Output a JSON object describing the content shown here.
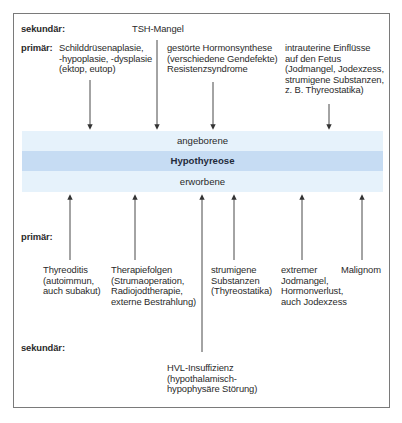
{
  "diagram": {
    "title": "Hypothyreose",
    "band": {
      "top_label": "angeborene",
      "center_label": "Hypothyreose",
      "bottom_label": "erworbene"
    },
    "colors": {
      "band_light": "#e6f2fb",
      "band_center": "#c6dcf3",
      "frame": "#7a7a7a",
      "lines": "#333333"
    },
    "congenital": {
      "secondary_label": "sekundär:",
      "primary_label": "primär:",
      "secondary": [
        {
          "lines": [
            "TSH-Mangel"
          ]
        }
      ],
      "primary": [
        {
          "lines": [
            "Schilddrüsenaplasie,",
            "-hypoplasie, -dysplasie",
            "(ektop, eutop)"
          ]
        },
        {
          "lines": [
            "gestörte Hormonsynthese",
            "(verschiedene Gendefekte)",
            "Resistenzsyndrome"
          ]
        },
        {
          "lines": [
            "intrauterine Einflüsse",
            "auf den Fetus",
            "(Jodmangel, Jodexzess,",
            "strumigene Substanzen,",
            "z. B. Thyreostatika)"
          ]
        }
      ]
    },
    "acquired": {
      "primary_label": "primär:",
      "secondary_label": "sekundär:",
      "primary": [
        {
          "lines": [
            "Thyreoditis",
            "(autoimmun,",
            "auch subakut)"
          ]
        },
        {
          "lines": [
            "Therapiefolgen",
            "(Strumaoperation,",
            "Radiojodtherapie,",
            "externe Bestrahlung)"
          ]
        },
        {
          "lines": [
            "strumigene",
            "Substanzen",
            "(Thyreostatika)"
          ]
        },
        {
          "lines": [
            "extremer",
            "Jodmangel,",
            "Hormonverlust,",
            "auch Jodexzess"
          ]
        },
        {
          "lines": [
            "Malignom"
          ]
        }
      ],
      "secondary": [
        {
          "lines": [
            "HVL-Insuffizienz",
            "(hypothalamisch-",
            "hypophysäre Störung)"
          ]
        }
      ]
    }
  }
}
